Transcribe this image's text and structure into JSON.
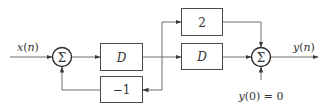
{
  "diagram": {
    "type": "block-diagram",
    "input_label": "x(n)",
    "output_label": "y(n)",
    "initial_condition": "y(0) = 0",
    "blocks": {
      "delay_left": "D",
      "feedback_gain": "−1",
      "forward_gain": "2",
      "delay_right": "D"
    },
    "summers": {
      "left": "Σ",
      "right": "Σ"
    },
    "colors": {
      "line": "#6e6e6e",
      "box": "#4a4a4a",
      "text": "#333333"
    }
  }
}
